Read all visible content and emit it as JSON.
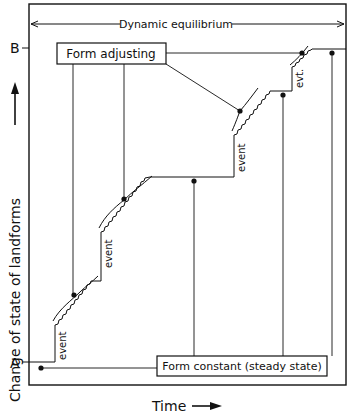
{
  "diagram": {
    "title": "",
    "top_label": "Dynamic equilibrium",
    "y_axis_label": "Change of state of landforms",
    "x_axis_label": "Time",
    "level_labels": {
      "upper": "B",
      "lower": "A"
    },
    "boxes": {
      "adjusting": "Form adjusting",
      "constant": "Form constant (steady state)"
    },
    "event_labels": [
      "event",
      "event",
      "event",
      "evt."
    ],
    "colors": {
      "ink": "#111111",
      "background": "#ffffff"
    }
  }
}
